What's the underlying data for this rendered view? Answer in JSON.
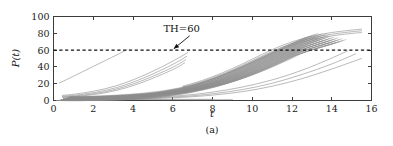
{
  "figure": {
    "caption": "(a)",
    "background": "#ffffff"
  },
  "chart_data": {
    "type": "line",
    "title": "",
    "subtitle": "",
    "xlabel": "t",
    "ylabel": "P(t)",
    "xlim": [
      0,
      16
    ],
    "ylim": [
      0,
      100
    ],
    "xticks": [
      0,
      2,
      4,
      6,
      8,
      10,
      12,
      14,
      16
    ],
    "yticks": [
      0,
      20,
      40,
      60,
      80,
      100
    ],
    "xticklabels": [
      "0",
      "2",
      "4",
      "6",
      "8",
      "10",
      "12",
      "14",
      "16"
    ],
    "yticklabels": [
      "0",
      "20",
      "40",
      "60",
      "80",
      "100"
    ],
    "grid": false,
    "legend": null,
    "legend_position": "none",
    "series_color": "#8c8c8c",
    "annotations": [
      {
        "name": "threshold-annotation",
        "text": "TH=60",
        "text_x": 6.45,
        "text_y": 81,
        "arrow_from_x": 6.85,
        "arrow_from_y": 77,
        "arrow_to_x": 6.05,
        "arrow_to_y": 61.5
      }
    ],
    "threshold": {
      "name": "TH",
      "value": 60,
      "style": "dashed",
      "color": "#111111",
      "label": "TH=60"
    },
    "series": [
      {
        "name": "curve-fast-1",
        "x": [
          0.3,
          0.8,
          1.4,
          2.0,
          2.6,
          3.2,
          3.7
        ],
        "y": [
          21.0,
          26.5,
          33.5,
          40.5,
          47.5,
          54.5,
          60.5
        ]
      },
      {
        "name": "curve-mid-1",
        "x": [
          0.45,
          1.5,
          2.6,
          3.6,
          4.5,
          5.4,
          6.2,
          6.75
        ],
        "y": [
          6.0,
          9.0,
          14.0,
          21.0,
          29.5,
          39.5,
          49.5,
          57.0
        ]
      },
      {
        "name": "curve-mid-2",
        "x": [
          0.45,
          1.5,
          2.6,
          3.6,
          4.5,
          5.4,
          6.2,
          6.7
        ],
        "y": [
          5.0,
          7.5,
          12.0,
          18.5,
          26.5,
          36.0,
          45.5,
          52.5
        ]
      },
      {
        "name": "curve-mid-3",
        "x": [
          0.45,
          1.5,
          2.6,
          3.6,
          4.5,
          5.4,
          6.2,
          6.65
        ],
        "y": [
          4.2,
          6.4,
          10.4,
          16.5,
          24.0,
          33.0,
          42.0,
          48.5
        ]
      },
      {
        "name": "curve-mid-4",
        "x": [
          0.45,
          1.5,
          2.6,
          3.6,
          4.5,
          5.4,
          6.2,
          6.6
        ],
        "y": [
          3.6,
          5.6,
          9.2,
          14.8,
          21.8,
          30.5,
          39.0,
          45.0
        ]
      },
      {
        "name": "curve-bundle-1",
        "x": [
          0.5,
          2.0,
          3.5,
          5.0,
          6.5,
          7.5,
          8.5,
          9.5,
          10.5,
          11.5,
          12.5,
          13.0
        ],
        "y": [
          2.0,
          3.0,
          5.0,
          8.5,
          15.0,
          21.5,
          30.0,
          40.0,
          51.0,
          62.0,
          72.5,
          77.5
        ]
      },
      {
        "name": "curve-bundle-2",
        "x": [
          0.5,
          2.0,
          3.5,
          5.0,
          6.5,
          7.5,
          8.5,
          9.5,
          10.5,
          11.5,
          12.5,
          13.2
        ],
        "y": [
          1.8,
          2.7,
          4.5,
          7.8,
          13.8,
          20.0,
          28.2,
          38.0,
          49.0,
          60.0,
          70.5,
          77.0
        ]
      },
      {
        "name": "curve-bundle-3",
        "x": [
          0.5,
          2.0,
          3.5,
          5.0,
          6.5,
          7.5,
          8.5,
          9.5,
          10.5,
          11.5,
          12.5,
          13.4
        ],
        "y": [
          1.6,
          2.5,
          4.2,
          7.2,
          12.8,
          18.7,
          26.5,
          36.0,
          47.0,
          58.0,
          68.5,
          76.5
        ]
      },
      {
        "name": "curve-bundle-4",
        "x": [
          0.5,
          2.0,
          3.5,
          5.0,
          6.5,
          7.5,
          8.5,
          9.5,
          10.5,
          11.5,
          12.5,
          13.5
        ],
        "y": [
          1.5,
          2.3,
          3.9,
          6.8,
          12.0,
          17.5,
          25.0,
          34.2,
          45.0,
          56.0,
          66.5,
          75.0
        ]
      },
      {
        "name": "curve-bundle-5",
        "x": [
          0.5,
          2.0,
          3.5,
          5.0,
          6.5,
          7.5,
          8.5,
          9.5,
          10.5,
          11.5,
          12.5,
          13.6
        ],
        "y": [
          1.4,
          2.1,
          3.6,
          6.3,
          11.3,
          16.5,
          23.6,
          32.5,
          43.0,
          54.0,
          64.5,
          74.0
        ]
      },
      {
        "name": "curve-bundle-6",
        "x": [
          0.5,
          2.0,
          3.5,
          5.0,
          6.5,
          7.5,
          8.5,
          9.5,
          10.5,
          11.5,
          12.5,
          13.8
        ],
        "y": [
          1.3,
          2.0,
          3.4,
          5.9,
          10.6,
          15.6,
          22.3,
          30.8,
          41.0,
          52.0,
          62.5,
          73.0
        ]
      },
      {
        "name": "curve-bundle-7",
        "x": [
          0.5,
          2.0,
          3.5,
          5.0,
          6.5,
          7.5,
          8.5,
          9.5,
          10.5,
          11.5,
          12.5,
          14.0
        ],
        "y": [
          1.2,
          1.9,
          3.2,
          5.5,
          10.0,
          14.7,
          21.0,
          29.2,
          39.0,
          50.0,
          60.5,
          72.0
        ]
      },
      {
        "name": "curve-bundle-8",
        "x": [
          0.5,
          2.0,
          3.5,
          5.0,
          6.5,
          7.5,
          8.5,
          9.5,
          10.5,
          11.5,
          12.5,
          14.2
        ],
        "y": [
          1.1,
          1.8,
          3.0,
          5.2,
          9.4,
          13.9,
          19.9,
          27.7,
          37.2,
          48.0,
          58.5,
          71.0
        ]
      },
      {
        "name": "curve-bundle-9",
        "x": [
          0.5,
          2.0,
          3.5,
          5.0,
          6.5,
          7.5,
          8.5,
          9.5,
          10.5,
          11.5,
          12.5,
          14.4
        ],
        "y": [
          1.0,
          1.7,
          2.8,
          4.9,
          8.9,
          13.1,
          18.8,
          26.3,
          35.5,
          46.0,
          56.5,
          70.0
        ]
      },
      {
        "name": "curve-low-1",
        "x": [
          0.6,
          2.5,
          4.5,
          6.5,
          8.0,
          9.5,
          11.0,
          12.5,
          13.8,
          14.8
        ],
        "y": [
          1.0,
          1.6,
          3.0,
          6.0,
          10.0,
          16.0,
          24.5,
          36.0,
          48.5,
          59.0
        ]
      },
      {
        "name": "curve-low-2",
        "x": [
          0.6,
          2.5,
          4.5,
          6.5,
          8.0,
          9.5,
          11.0,
          12.5,
          14.0,
          15.2
        ],
        "y": [
          0.8,
          1.3,
          2.4,
          4.8,
          8.0,
          13.0,
          20.5,
          31.0,
          43.5,
          55.5
        ]
      },
      {
        "name": "curve-low-3",
        "x": [
          0.6,
          2.5,
          4.5,
          6.5,
          8.0,
          9.5,
          11.0,
          12.5,
          14.0,
          15.5
        ],
        "y": [
          0.6,
          1.0,
          1.9,
          3.8,
          6.4,
          10.5,
          17.0,
          26.0,
          37.5,
          50.0
        ]
      },
      {
        "name": "curve-top-1",
        "x": [
          6.5,
          7.5,
          8.5,
          9.5,
          10.5,
          11.5,
          12.5,
          13.5,
          14.5,
          15.5
        ],
        "y": [
          17.0,
          24.0,
          33.0,
          43.5,
          55.0,
          65.5,
          73.5,
          79.0,
          82.5,
          85.0
        ]
      },
      {
        "name": "curve-top-2",
        "x": [
          6.5,
          7.5,
          8.5,
          9.5,
          10.5,
          11.5,
          12.5,
          13.5,
          14.5,
          15.5
        ],
        "y": [
          16.0,
          22.8,
          31.5,
          41.8,
          53.0,
          63.5,
          71.5,
          77.0,
          80.5,
          83.0
        ]
      },
      {
        "name": "curve-top-3",
        "x": [
          6.5,
          7.5,
          8.5,
          9.5,
          10.5,
          11.5,
          12.5,
          13.5,
          14.5,
          15.5
        ],
        "y": [
          15.0,
          21.6,
          30.0,
          40.0,
          51.0,
          61.5,
          69.5,
          75.0,
          78.5,
          81.0
        ]
      },
      {
        "name": "curve-base-1",
        "x": [
          0.5,
          2.0,
          4.0,
          6.0,
          7.0,
          8.0
        ],
        "y": [
          2.5,
          2.0,
          1.6,
          1.4,
          1.4,
          1.5
        ]
      },
      {
        "name": "curve-base-2",
        "x": [
          0.5,
          2.0,
          4.0,
          6.0,
          7.5,
          9.0
        ],
        "y": [
          1.8,
          1.5,
          1.2,
          1.0,
          1.0,
          1.1
        ]
      }
    ]
  }
}
